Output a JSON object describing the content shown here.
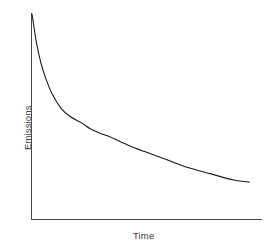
{
  "chart_data": {
    "type": "line",
    "title": "",
    "subtitle": "",
    "xlabel": "Time",
    "ylabel": "Emissions",
    "legend": [],
    "legend_position": "none",
    "grid": false,
    "axis_ticks": false,
    "tick_labels": {
      "x": [],
      "y": []
    },
    "xlim": [
      0,
      1
    ],
    "ylim": [
      0,
      1
    ],
    "annotations": [],
    "series": [
      {
        "name": "Emissions",
        "color": "#1a1a1a",
        "line_width": 1.1,
        "x": [
          0.0,
          0.02,
          0.04,
          0.06,
          0.09,
          0.13,
          0.17,
          0.22,
          0.26,
          0.3,
          0.35,
          0.43,
          0.5,
          0.6,
          0.7,
          0.8,
          0.9,
          0.97
        ],
        "y": [
          1.0,
          0.86,
          0.76,
          0.69,
          0.61,
          0.54,
          0.5,
          0.47,
          0.44,
          0.42,
          0.4,
          0.36,
          0.33,
          0.29,
          0.25,
          0.22,
          0.19,
          0.18
        ]
      }
    ]
  },
  "axes": {
    "y_axis_name": "y-axis-line",
    "x_axis_name": "x-axis-line",
    "color": "#4a4a4a"
  },
  "labels": {
    "y": "Emissions",
    "x": "Time"
  }
}
